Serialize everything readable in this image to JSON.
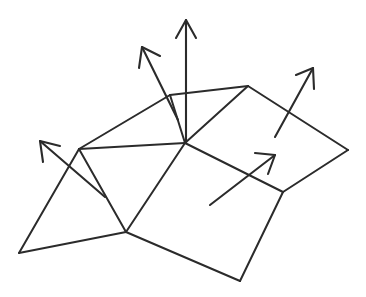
{
  "figure": {
    "background_color": "#ffffff",
    "line_color": "#2b2b2b",
    "width": 366,
    "height": 297
  },
  "mesh": {
    "name": "quad-mesh",
    "vertices": [
      {
        "id": "v-left-outer",
        "label": "left outer corner",
        "x": 19,
        "y": 253
      },
      {
        "id": "v-left-ridge",
        "label": "left ridge vertex",
        "x": 79,
        "y": 149
      },
      {
        "id": "v-upper-ridge",
        "label": "upper ridge vertex",
        "x": 170,
        "y": 95
      },
      {
        "id": "v-top-right",
        "label": "top right vertex",
        "x": 248,
        "y": 86
      },
      {
        "id": "v-center",
        "label": "center vertex",
        "x": 185,
        "y": 143
      },
      {
        "id": "v-right-outer",
        "label": "right outer corner",
        "x": 348,
        "y": 150
      },
      {
        "id": "v-right-lower",
        "label": "right lower vertex",
        "x": 283,
        "y": 192
      },
      {
        "id": "v-bottom-left",
        "label": "bottom left vertex",
        "x": 126,
        "y": 232
      },
      {
        "id": "v-bottom",
        "label": "bottom vertex",
        "x": 240,
        "y": 281
      }
    ],
    "edges": [
      {
        "id": "e-leftouter-leftridge",
        "label": "left outer to left ridge",
        "path": "M 19 253 L 79 149"
      },
      {
        "id": "e-leftridge-upperridge",
        "label": "left ridge to upper ridge",
        "path": "M 79 149 L 170 95"
      },
      {
        "id": "e-upperridge-topright",
        "label": "upper ridge to top right",
        "path": "M 170 95 L 248 86"
      },
      {
        "id": "e-leftridge-center",
        "label": "left ridge to center",
        "path": "M 79 149 L 185 143"
      },
      {
        "id": "e-center-upperridge",
        "label": "center to upper ridge",
        "path": "M 185 143 L 170 95"
      },
      {
        "id": "e-center-topright",
        "label": "center to top right",
        "path": "M 185 143 L 248 86"
      },
      {
        "id": "e-topright-rightouter",
        "label": "top right to right outer",
        "path": "M 248 86 L 348 150"
      },
      {
        "id": "e-rightouter-rightlower",
        "label": "right outer to right lower",
        "path": "M 348 150 L 283 192"
      },
      {
        "id": "e-center-rightlower",
        "label": "center to right lower",
        "path": "M 185 143 L 283 192"
      },
      {
        "id": "e-leftouter-bottomleft",
        "label": "left outer to bottom left",
        "path": "M 19 253 L 126 232"
      },
      {
        "id": "e-leftridge-bottomleft",
        "label": "left ridge to bottom left",
        "path": "M 79 149 L 126 232"
      },
      {
        "id": "e-center-bottomleft",
        "label": "center to bottom left",
        "path": "M 185 143 L 126 232"
      },
      {
        "id": "e-bottomleft-bottom",
        "label": "bottom left to bottom",
        "path": "M 126 232 L 240 281"
      },
      {
        "id": "e-bottom-rightlower",
        "label": "bottom to right lower",
        "path": "M 240 281 L 283 192"
      }
    ]
  },
  "normals": [
    {
      "id": "normal-up",
      "label": "vertical normal at center",
      "shaft": "M 186 143 L 186 20",
      "head": "M 176 38 L 186 20 L 196 38"
    },
    {
      "id": "normal-upper-left",
      "label": "upper-left normal",
      "shaft": "M 178 120 L 142 47",
      "head": "M 139 68 L 142 47 L 160 56"
    },
    {
      "id": "normal-left",
      "label": "left normal",
      "shaft": "M 105 197 L 40 141",
      "head": "M 43 162 L 40 141 L 60 146"
    },
    {
      "id": "normal-right",
      "label": "right normal",
      "shaft": "M 275 137 L 313 68",
      "head": "M 296 75 L 313 68 L 314 89"
    },
    {
      "id": "normal-lower-right",
      "label": "lower-right normal",
      "shaft": "M 210 205 L 275 155",
      "head": "M 255 153 L 275 155 L 268 174"
    }
  ]
}
